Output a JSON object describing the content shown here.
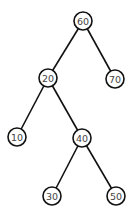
{
  "diagram": {
    "type": "binary-tree",
    "nodes": [
      {
        "id": "n60",
        "label": "60",
        "x": 83,
        "y": 21
      },
      {
        "id": "n20",
        "label": "20",
        "x": 48,
        "y": 78
      },
      {
        "id": "n70",
        "label": "70",
        "x": 115,
        "y": 79
      },
      {
        "id": "n10",
        "label": "10",
        "x": 17,
        "y": 137
      },
      {
        "id": "n40",
        "label": "40",
        "x": 82,
        "y": 138
      },
      {
        "id": "n30",
        "label": "30",
        "x": 52,
        "y": 196
      },
      {
        "id": "n50",
        "label": "50",
        "x": 116,
        "y": 196
      }
    ],
    "edges": [
      {
        "from": "n60",
        "to": "n20"
      },
      {
        "from": "n60",
        "to": "n70"
      },
      {
        "from": "n20",
        "to": "n10"
      },
      {
        "from": "n20",
        "to": "n40"
      },
      {
        "from": "n40",
        "to": "n30"
      },
      {
        "from": "n40",
        "to": "n50"
      }
    ],
    "node_radius": 9,
    "colors": {
      "stroke": "#111111",
      "text": "#444444",
      "fill": "#ffffff",
      "background": "#ffffff"
    }
  }
}
